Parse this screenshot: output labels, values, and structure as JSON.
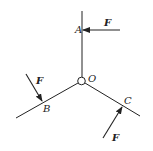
{
  "diagram": {
    "type": "statics-force-diagram",
    "hinge": {
      "label": "O"
    },
    "rods": [
      {
        "name": "OA",
        "point_label": "A",
        "direction": "vertical-up"
      },
      {
        "name": "OB",
        "point_label": "B",
        "direction": "down-left"
      },
      {
        "name": "OC",
        "point_label": "C",
        "direction": "down-right"
      }
    ],
    "forces": [
      {
        "at": "A",
        "label": "F",
        "direction": "horizontal-left"
      },
      {
        "at": "B",
        "label": "F",
        "direction": "down-right toward rod"
      },
      {
        "at": "C",
        "label": "F",
        "direction": "up-right toward rod"
      }
    ],
    "colors": {
      "line": "#222222",
      "background": "#ffffff"
    }
  }
}
